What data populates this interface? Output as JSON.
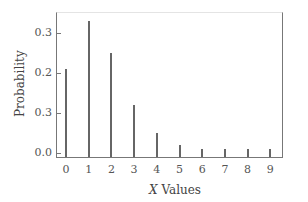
{
  "chart_data": {
    "type": "bar",
    "title": "",
    "xlabel": "X Values",
    "ylabel": "Probability",
    "categories": [
      "0",
      "1",
      "2",
      "3",
      "4",
      "5",
      "6",
      "7",
      "8",
      "9"
    ],
    "values": [
      0.21,
      0.33,
      0.25,
      0.12,
      0.05,
      0.02,
      0.01,
      0.01,
      0.01,
      0.01
    ],
    "yticks": [
      "0.3",
      "0.2",
      "0.3",
      "0.0"
    ],
    "ylim": [
      0,
      0.35
    ],
    "grid": false,
    "legend": null
  },
  "axes": {
    "x_title_var": "X",
    "x_title_rest": " Values",
    "y_title": "Probability"
  }
}
